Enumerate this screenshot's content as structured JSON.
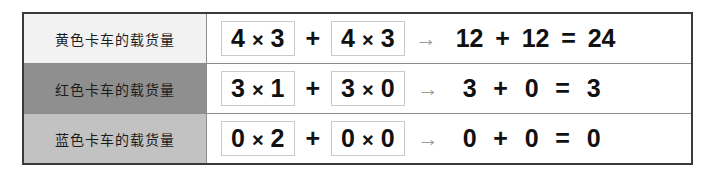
{
  "table": {
    "rows": [
      {
        "label": "黄色卡车的载货量",
        "label_bg": "#f2f2f2",
        "term1": {
          "a": "4",
          "times": "×",
          "b": "3"
        },
        "plus": "+",
        "term2": {
          "a": "4",
          "times": "×",
          "b": "3"
        },
        "arrow": "→",
        "result": {
          "left": "12",
          "op": "+",
          "right": "12",
          "equals": "=",
          "total": "24"
        }
      },
      {
        "label": "红色卡车的载货量",
        "label_bg": "#8f8f8f",
        "term1": {
          "a": "3",
          "times": "×",
          "b": "1"
        },
        "plus": "+",
        "term2": {
          "a": "3",
          "times": "×",
          "b": "0"
        },
        "arrow": "→",
        "result": {
          "left": "3",
          "op": "+",
          "right": "0",
          "equals": "=",
          "total": "3"
        }
      },
      {
        "label": "蓝色卡车的载货量",
        "label_bg": "#c2c2c2",
        "term1": {
          "a": "0",
          "times": "×",
          "b": "2"
        },
        "plus": "+",
        "term2": {
          "a": "0",
          "times": "×",
          "b": "0"
        },
        "arrow": "→",
        "result": {
          "left": "0",
          "op": "+",
          "right": "0",
          "equals": "=",
          "total": "0"
        }
      }
    ]
  },
  "colors": {
    "frame": "#3a3a3a",
    "divider": "#8d8d8d",
    "term_box_border": "#c9c9c9",
    "arrow": "#9a9a9a",
    "text": "#111111"
  }
}
